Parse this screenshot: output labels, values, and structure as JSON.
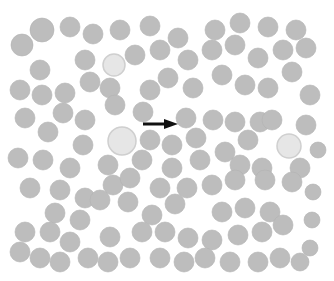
{
  "figure": {
    "type": "blood-smear-micrograph",
    "background": "#ffffff",
    "field": {
      "x": 13,
      "y": 15,
      "w": 309,
      "h": 255,
      "color": "#fdfdfd"
    },
    "cell_color": "#bdbdbd",
    "cell_edge": "#b2b2b2",
    "pale_cell_color": "#e6e6e6",
    "arrow": {
      "x1": 143,
      "y1": 124,
      "x2": 178,
      "y2": 124,
      "color": "#111111",
      "label": "arrow pointing to cell"
    },
    "pale_cells": [
      {
        "cx": 122,
        "cy": 141,
        "r": 14
      },
      {
        "cx": 289,
        "cy": 146,
        "r": 12
      },
      {
        "cx": 114,
        "cy": 65,
        "r": 11
      }
    ],
    "cells": [
      [
        42,
        30,
        12
      ],
      [
        70,
        27,
        10
      ],
      [
        93,
        34,
        10
      ],
      [
        120,
        30,
        10
      ],
      [
        150,
        26,
        10
      ],
      [
        178,
        38,
        10
      ],
      [
        215,
        30,
        10
      ],
      [
        240,
        23,
        10
      ],
      [
        268,
        27,
        10
      ],
      [
        296,
        30,
        10
      ],
      [
        22,
        45,
        11
      ],
      [
        40,
        70,
        10
      ],
      [
        85,
        60,
        10
      ],
      [
        135,
        55,
        10
      ],
      [
        160,
        50,
        10
      ],
      [
        188,
        60,
        10
      ],
      [
        212,
        50,
        10
      ],
      [
        235,
        45,
        10
      ],
      [
        258,
        58,
        10
      ],
      [
        283,
        50,
        10
      ],
      [
        306,
        48,
        10
      ],
      [
        20,
        90,
        10
      ],
      [
        42,
        95,
        10
      ],
      [
        65,
        93,
        10
      ],
      [
        90,
        82,
        10
      ],
      [
        110,
        88,
        10
      ],
      [
        150,
        90,
        10
      ],
      [
        168,
        78,
        10
      ],
      [
        193,
        88,
        10
      ],
      [
        222,
        75,
        10
      ],
      [
        245,
        85,
        10
      ],
      [
        268,
        88,
        10
      ],
      [
        292,
        72,
        10
      ],
      [
        310,
        95,
        10
      ],
      [
        25,
        118,
        10
      ],
      [
        63,
        113,
        10
      ],
      [
        85,
        120,
        10
      ],
      [
        115,
        105,
        10
      ],
      [
        143,
        112,
        10
      ],
      [
        186,
        118,
        10
      ],
      [
        213,
        120,
        10
      ],
      [
        235,
        122,
        10
      ],
      [
        260,
        122,
        10
      ],
      [
        306,
        125,
        10
      ],
      [
        48,
        132,
        10
      ],
      [
        83,
        145,
        10
      ],
      [
        150,
        140,
        10
      ],
      [
        172,
        145,
        10
      ],
      [
        196,
        138,
        10
      ],
      [
        225,
        152,
        10
      ],
      [
        248,
        140,
        10
      ],
      [
        272,
        120,
        10
      ],
      [
        18,
        158,
        10
      ],
      [
        43,
        160,
        10
      ],
      [
        70,
        168,
        10
      ],
      [
        108,
        165,
        10
      ],
      [
        142,
        160,
        10
      ],
      [
        172,
        168,
        10
      ],
      [
        200,
        160,
        10
      ],
      [
        240,
        165,
        10
      ],
      [
        262,
        168,
        10
      ],
      [
        300,
        168,
        10
      ],
      [
        318,
        150,
        8
      ],
      [
        30,
        188,
        10
      ],
      [
        60,
        190,
        10
      ],
      [
        85,
        198,
        10
      ],
      [
        113,
        185,
        10
      ],
      [
        130,
        178,
        10
      ],
      [
        160,
        188,
        10
      ],
      [
        187,
        188,
        10
      ],
      [
        212,
        185,
        10
      ],
      [
        235,
        180,
        10
      ],
      [
        265,
        180,
        10
      ],
      [
        292,
        182,
        10
      ],
      [
        313,
        192,
        8
      ],
      [
        55,
        213,
        10
      ],
      [
        80,
        220,
        10
      ],
      [
        100,
        200,
        10
      ],
      [
        128,
        202,
        10
      ],
      [
        152,
        215,
        10
      ],
      [
        175,
        204,
        10
      ],
      [
        222,
        212,
        10
      ],
      [
        245,
        208,
        10
      ],
      [
        270,
        212,
        10
      ],
      [
        312,
        220,
        8
      ],
      [
        25,
        232,
        10
      ],
      [
        50,
        232,
        10
      ],
      [
        70,
        242,
        10
      ],
      [
        110,
        237,
        10
      ],
      [
        142,
        232,
        10
      ],
      [
        165,
        232,
        10
      ],
      [
        188,
        238,
        10
      ],
      [
        212,
        240,
        10
      ],
      [
        238,
        235,
        10
      ],
      [
        262,
        232,
        10
      ],
      [
        283,
        225,
        10
      ],
      [
        310,
        248,
        8
      ],
      [
        20,
        252,
        10
      ],
      [
        40,
        258,
        10
      ],
      [
        60,
        262,
        10
      ],
      [
        88,
        258,
        10
      ],
      [
        108,
        262,
        10
      ],
      [
        130,
        258,
        10
      ],
      [
        160,
        258,
        10
      ],
      [
        184,
        262,
        10
      ],
      [
        205,
        258,
        10
      ],
      [
        230,
        262,
        10
      ],
      [
        258,
        262,
        10
      ],
      [
        280,
        258,
        10
      ],
      [
        300,
        262,
        9
      ]
    ]
  }
}
